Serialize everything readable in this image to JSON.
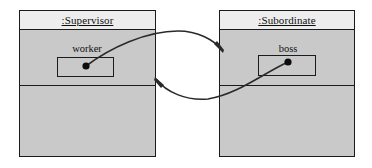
{
  "diagram": {
    "kind": "uml-object-collaboration-diagram",
    "background_color": "#ffffff",
    "line_color": "#2a2a2a",
    "objects": [
      {
        "id": "supervisor",
        "name": ":Supervisor",
        "name_underlined": true,
        "header_fill": "#ededed",
        "body_fill": "#c9c9c9",
        "border_color": "#1b1b1b",
        "compartments": 3,
        "slot": {
          "label": "worker",
          "has_link_endpoint_dot": true,
          "dot_color": "#0d0d0d"
        }
      },
      {
        "id": "subordinate",
        "name": ":Subordinate",
        "name_underlined": true,
        "header_fill": "#ededed",
        "body_fill": "#c9c9c9",
        "border_color": "#1b1b1b",
        "compartments": 3,
        "slot": {
          "label": "boss",
          "has_link_endpoint_dot": true,
          "dot_color": "#0d0d0d"
        }
      }
    ],
    "links": [
      {
        "id": "worker-to-subordinate",
        "from": "supervisor.worker",
        "to": "subordinate",
        "style": "curved-arc-over",
        "arrowhead": "open-filled",
        "direction": "left-to-right"
      },
      {
        "id": "boss-to-supervisor",
        "from": "subordinate.boss",
        "to": "supervisor",
        "style": "curved-arc-under",
        "arrowhead": "open-filled",
        "direction": "right-to-left"
      }
    ]
  }
}
